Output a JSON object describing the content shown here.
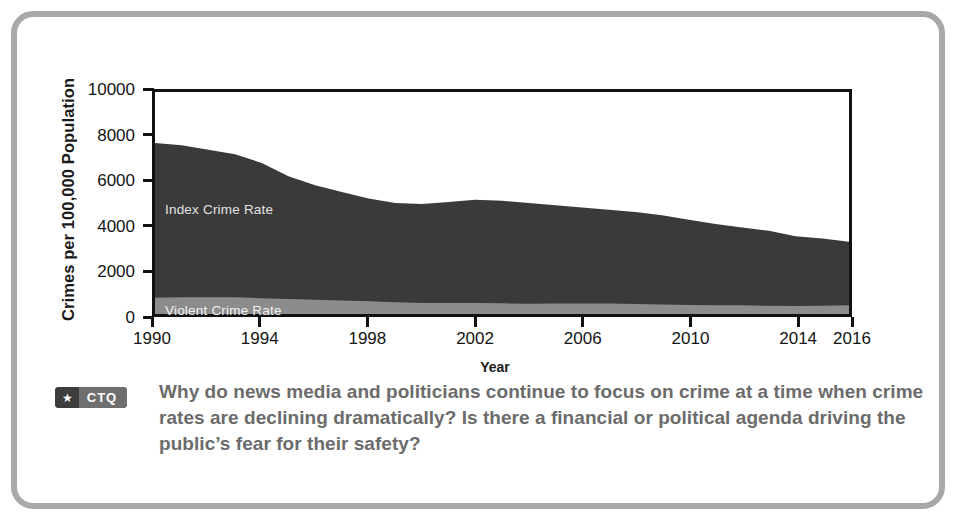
{
  "figure": {
    "frame_color": "#a9a9a9",
    "background": "#ffffff"
  },
  "chart_data": {
    "type": "area",
    "title": "",
    "xlabel": "Year",
    "ylabel": "Crimes per 100,000 Population",
    "xlim": [
      1990,
      2016
    ],
    "ylim": [
      0,
      10000
    ],
    "xticks": [
      1990,
      1994,
      1998,
      2002,
      2006,
      2010,
      2014,
      2016
    ],
    "xtick_labels": [
      "1990",
      "1994",
      "1998",
      "2002",
      "2006",
      "2010",
      "2014",
      "2016"
    ],
    "yticks": [
      0,
      2000,
      4000,
      6000,
      8000,
      10000
    ],
    "ytick_labels": [
      "0",
      "2000",
      "4000",
      "6000",
      "8000",
      "10000"
    ],
    "grid": false,
    "legend_position": "inside-plot-labels",
    "x": [
      1990,
      1991,
      1992,
      1993,
      1994,
      1995,
      1996,
      1997,
      1998,
      1999,
      2000,
      2001,
      2002,
      2003,
      2004,
      2005,
      2006,
      2007,
      2008,
      2009,
      2010,
      2011,
      2012,
      2013,
      2014,
      2015,
      2016
    ],
    "series": [
      {
        "name": "Index Crime Rate",
        "color": "#3a3a3a",
        "values": [
          7700,
          7600,
          7400,
          7200,
          6800,
          6200,
          5800,
          5500,
          5200,
          5000,
          4950,
          5050,
          5150,
          5100,
          5000,
          4900,
          4800,
          4700,
          4600,
          4450,
          4250,
          4050,
          3900,
          3750,
          3500,
          3400,
          3250
        ]
      },
      {
        "name": "Violent Crime Rate",
        "color": "#8c8c8c",
        "values": [
          730,
          760,
          760,
          750,
          710,
          680,
          640,
          610,
          570,
          525,
          500,
          500,
          495,
          480,
          465,
          470,
          475,
          470,
          455,
          430,
          405,
          390,
          390,
          370,
          365,
          375,
          390
        ]
      }
    ],
    "annotations": [
      {
        "text": "Index Crime Rate",
        "x": 1990.6,
        "y": 4900,
        "color": "#e2e2e2"
      },
      {
        "text": "Violent Crime Rate",
        "x": 1990.6,
        "y": 450,
        "color": "#f0f0f0"
      }
    ]
  },
  "ctq": {
    "badge_star_icon": "star-icon",
    "badge_label": "CTQ",
    "question": "Why do news media and politicians continue to focus on crime at a time when crime rates are declining dramatically? Is there a financial or political agenda driving the public’s fear for their safety?"
  }
}
